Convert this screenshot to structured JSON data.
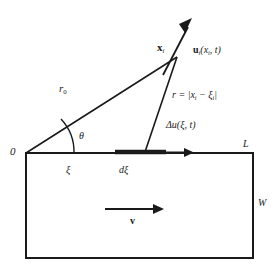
{
  "figure": {
    "background_color": "#ffffff",
    "line_color": "#1a1a1a"
  },
  "labels": {
    "origin": "0",
    "theta": "θ",
    "r0_base": "r",
    "r0_sub": "0",
    "xi": "ξ",
    "d_xi_d": "d",
    "d_xi_sym": "ξ",
    "L": "L",
    "W": "W",
    "v": "v",
    "field_point_base": "x",
    "field_point_sub": "i",
    "displacement_u": "u",
    "displacement_u_sub": "i",
    "displacement_arg": "(x",
    "displacement_arg_sub": "i",
    "displacement_arg_tail": ", t)",
    "r_eq_lead": "r",
    "r_eq_rel": " = |x",
    "r_eq_sub1": "i",
    "r_eq_mid": " − ξ",
    "r_eq_sub2": "i",
    "r_eq_tail": "|",
    "delta_u_lead": "Δu(",
    "delta_u_arg": "ξ",
    "delta_u_tail": ", t)"
  },
  "geometry": {
    "origin": [
      26,
      153
    ],
    "field_point": [
      177,
      57
    ],
    "arrow_tip": [
      192,
      20
    ],
    "source_point": [
      145,
      152
    ],
    "rect": {
      "x": 26,
      "y": 153,
      "width": 227,
      "height": 105
    },
    "d_xi_segment": [
      115,
      166
    ],
    "top_arrow_tip": 192,
    "velocity_arrow": {
      "y": 209,
      "x1": 105,
      "x2": 162
    }
  }
}
